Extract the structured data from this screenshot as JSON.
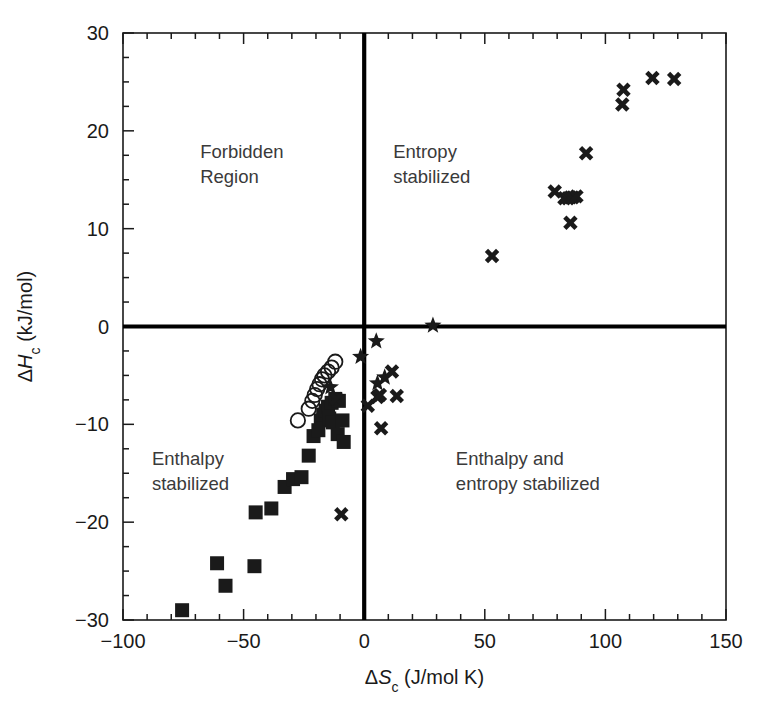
{
  "chart_data": {
    "type": "scatter",
    "title": "",
    "xlabel": "ΔSc (J/mol K)",
    "ylabel": "ΔHc (kJ/mol)",
    "xlabel_parts": {
      "delta": "Δ",
      "symbol": "S",
      "subscript": "c",
      "units": "(J/mol K)"
    },
    "ylabel_parts": {
      "delta": "Δ",
      "symbol": "H",
      "subscript": "c",
      "units": "(kJ/mol)"
    },
    "xlim": [
      -100,
      150
    ],
    "ylim": [
      -30,
      30
    ],
    "xticks": [
      -100,
      -50,
      0,
      50,
      100,
      150
    ],
    "xtick_labels": [
      "−100",
      "−50",
      "0",
      "50",
      "100",
      "150"
    ],
    "yticks": [
      -30,
      -20,
      -10,
      0,
      10,
      20,
      30
    ],
    "ytick_labels": [
      "−30",
      "−20",
      "−10",
      "0",
      "10",
      "20",
      "30"
    ],
    "x_minor_step": 10,
    "y_minor_step": 2.5,
    "grid": false,
    "legend": "none",
    "zero_lines": {
      "x": 0,
      "y": 0,
      "color": "#000000"
    },
    "annotations": [
      {
        "text_line1": "Forbidden",
        "text_line2": "Region",
        "x": -68,
        "y": 17.2,
        "quadrant": "upper-left"
      },
      {
        "text_line1": "Entropy",
        "text_line2": "stabilized",
        "x": 12,
        "y": 17.2,
        "quadrant": "upper-right"
      },
      {
        "text_line1": "Enthalpy",
        "text_line2": "stabilized",
        "x": -88,
        "y": -14.2,
        "quadrant": "lower-left"
      },
      {
        "text_line1": "Enthalpy and",
        "text_line2": "entropy stabilized",
        "x": 38,
        "y": -14.2,
        "quadrant": "lower-right"
      }
    ],
    "series": [
      {
        "name": "filled-squares",
        "marker": "square",
        "points": [
          [
            -75.5,
            -29.0
          ],
          [
            -61.0,
            -24.2
          ],
          [
            -57.5,
            -26.5
          ],
          [
            -45.5,
            -24.5
          ],
          [
            -45.0,
            -19.0
          ],
          [
            -38.5,
            -18.6
          ],
          [
            -33.0,
            -16.4
          ],
          [
            -29.5,
            -15.6
          ],
          [
            -26.0,
            -15.4
          ],
          [
            -23.0,
            -13.2
          ],
          [
            -21.0,
            -11.2
          ],
          [
            -19.0,
            -10.6
          ],
          [
            -18.0,
            -9.6
          ],
          [
            -17.0,
            -9.0
          ],
          [
            -16.0,
            -8.6
          ],
          [
            -15.0,
            -8.2
          ],
          [
            -14.5,
            -9.4
          ],
          [
            -13.5,
            -7.8
          ],
          [
            -13.0,
            -9.8
          ],
          [
            -12.0,
            -7.4
          ],
          [
            -11.0,
            -11.0
          ],
          [
            -10.5,
            -7.6
          ],
          [
            -9.0,
            -9.6
          ],
          [
            -8.5,
            -11.8
          ]
        ]
      },
      {
        "name": "open-circles",
        "marker": "circle",
        "points": [
          [
            -27.5,
            -9.6
          ],
          [
            -23.0,
            -8.4
          ],
          [
            -21.5,
            -7.6
          ],
          [
            -20.5,
            -7.0
          ],
          [
            -19.5,
            -6.4
          ],
          [
            -18.5,
            -5.9
          ],
          [
            -17.5,
            -5.4
          ],
          [
            -16.5,
            -5.0
          ],
          [
            -15.0,
            -4.6
          ],
          [
            -13.5,
            -4.2
          ],
          [
            -12.0,
            -3.6
          ]
        ]
      },
      {
        "name": "filled-stars",
        "marker": "star",
        "points": [
          [
            -14.0,
            -6.2
          ],
          [
            5.0,
            -1.5
          ],
          [
            -1.5,
            -3.1
          ],
          [
            5.5,
            -5.8
          ],
          [
            8.5,
            -5.2
          ],
          [
            28.5,
            0.1
          ]
        ]
      },
      {
        "name": "crosses",
        "marker": "cross",
        "points": [
          [
            -11.5,
            -7.4
          ],
          [
            -9.5,
            -19.2
          ],
          [
            1.5,
            -8.1
          ],
          [
            5.5,
            -7.2
          ],
          [
            6.5,
            -7.0
          ],
          [
            7.0,
            -10.4
          ],
          [
            11.5,
            -4.6
          ],
          [
            13.5,
            -7.1
          ],
          [
            53.0,
            7.2
          ],
          [
            79.0,
            13.8
          ],
          [
            83.0,
            13.1
          ],
          [
            84.5,
            13.1
          ],
          [
            85.5,
            13.2
          ],
          [
            86.5,
            13.2
          ],
          [
            88.0,
            13.3
          ],
          [
            85.5,
            10.6
          ],
          [
            92.0,
            17.7
          ],
          [
            107.0,
            22.7
          ],
          [
            107.5,
            24.2
          ],
          [
            119.5,
            25.4
          ],
          [
            128.5,
            25.3
          ]
        ]
      }
    ]
  },
  "plot_geometry": {
    "left_px": 123,
    "right_px": 726,
    "top_px": 33,
    "bottom_px": 620
  }
}
